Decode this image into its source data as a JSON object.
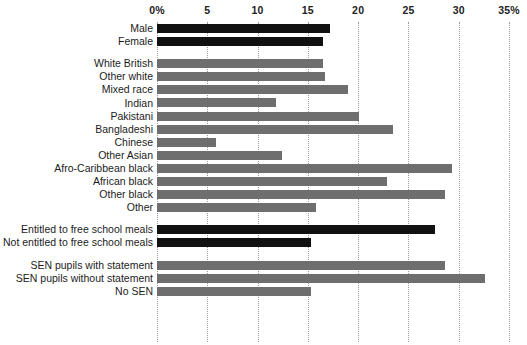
{
  "chart_data": {
    "type": "bar",
    "orientation": "horizontal",
    "title": "",
    "xlabel": "",
    "ylabel": "",
    "xlim": [
      0,
      35
    ],
    "grid": true,
    "legend": null,
    "xticks": [
      {
        "value": 0,
        "label": "0%"
      },
      {
        "value": 5,
        "label": "5"
      },
      {
        "value": 10,
        "label": "10"
      },
      {
        "value": 15,
        "label": "15"
      },
      {
        "value": 20,
        "label": "20"
      },
      {
        "value": 25,
        "label": "25"
      },
      {
        "value": 30,
        "label": "30"
      },
      {
        "value": 35,
        "label": "35%"
      }
    ],
    "colors": {
      "dark": "#111111",
      "grey": "#6e6e6e",
      "gridline": "#9a9a9a",
      "background": "#ffffff"
    },
    "groups": [
      {
        "name": "gender",
        "color_key": "dark",
        "categories": [
          "Male",
          "Female"
        ],
        "values": [
          17.2,
          16.5
        ]
      },
      {
        "name": "ethnicity",
        "color_key": "grey",
        "categories": [
          "White British",
          "Other white",
          "Mixed race",
          "Indian",
          "Pakistani",
          "Bangladeshi",
          "Chinese",
          "Other Asian",
          "Afro-Caribbean black",
          "African black",
          "Other black",
          "Other"
        ],
        "values": [
          16.5,
          16.7,
          19.0,
          11.8,
          20.1,
          23.5,
          5.9,
          12.4,
          29.3,
          22.9,
          28.6,
          15.8
        ]
      },
      {
        "name": "free-school-meals",
        "color_key": "dark",
        "categories": [
          "Entitled to free school meals",
          "Not entitled to free school meals"
        ],
        "values": [
          27.6,
          15.3
        ]
      },
      {
        "name": "special-educational-needs",
        "color_key": "grey",
        "categories": [
          "SEN pupils with statement",
          "SEN pupils without statement",
          "No SEN"
        ],
        "values": [
          28.6,
          32.6,
          15.3
        ]
      }
    ]
  }
}
